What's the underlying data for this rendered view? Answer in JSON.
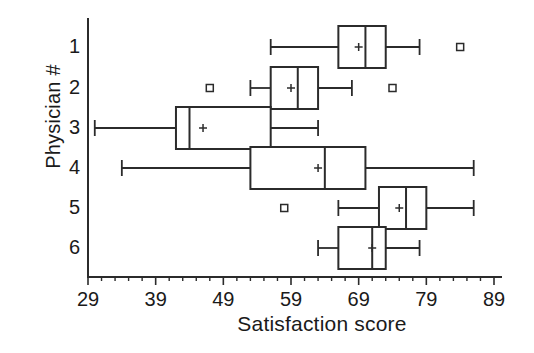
{
  "chart": {
    "type": "box",
    "title": "",
    "xlabel": "Satisfaction score",
    "ylabel": "Physician #",
    "grid": false,
    "legend": "none",
    "orientation": "horizontal",
    "xlim": [
      29,
      89
    ],
    "x_ticks": [
      29,
      39,
      49,
      59,
      69,
      79,
      89
    ],
    "x_tick_labels": [
      "29",
      "39",
      "49",
      "59",
      "69",
      "79",
      "89"
    ],
    "x_minor_tick_step": 2,
    "y_categories": [
      "1",
      "2",
      "3",
      "4",
      "5",
      "6"
    ],
    "series_name": "Physician satisfaction score distribution"
  },
  "chart_data": {
    "type": "box",
    "title": "",
    "xlabel": "Satisfaction score",
    "ylabel": "Physician #",
    "xlim": [
      29,
      89
    ],
    "grid": false,
    "legend": "none",
    "categories": [
      "1",
      "2",
      "3",
      "4",
      "5",
      "6"
    ],
    "boxes": [
      {
        "category": "1",
        "whisker_low": 56,
        "q1": 66,
        "median": 70,
        "q3": 73,
        "whisker_high": 78,
        "mean": 69,
        "outliers": [
          84
        ]
      },
      {
        "category": "2",
        "whisker_low": 53,
        "q1": 56,
        "median": 60,
        "q3": 63,
        "whisker_high": 68,
        "mean": 59,
        "outliers": [
          47,
          74
        ]
      },
      {
        "category": "3",
        "whisker_low": 30,
        "q1": 42,
        "median": 44,
        "q3": 56,
        "whisker_high": 63,
        "mean": 46,
        "outliers": []
      },
      {
        "category": "4",
        "whisker_low": 34,
        "q1": 53,
        "median": 64,
        "q3": 70,
        "whisker_high": 86,
        "mean": 63,
        "outliers": []
      },
      {
        "category": "5",
        "whisker_low": 66,
        "q1": 72,
        "median": 76,
        "q3": 79,
        "whisker_high": 86,
        "mean": 75,
        "outliers": [
          58
        ]
      },
      {
        "category": "6",
        "whisker_low": 63,
        "q1": 66,
        "median": 71,
        "q3": 73,
        "whisker_high": 78,
        "mean": 71,
        "outliers": []
      }
    ]
  },
  "axes": {
    "x_tick_labels": [
      "29",
      "39",
      "49",
      "59",
      "69",
      "79",
      "89"
    ],
    "y_tick_labels": [
      "1",
      "2",
      "3",
      "4",
      "5",
      "6"
    ]
  },
  "colors": {
    "ink": "#2b2b2b",
    "background": "#ffffff",
    "box_fill": "#ffffff"
  }
}
